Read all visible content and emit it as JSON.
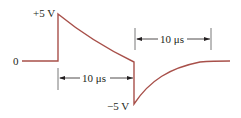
{
  "diagram": {
    "title": "",
    "labels": {
      "zero": "0",
      "plus_peak": "+5 V",
      "minus_peak": "−5 V",
      "interval_pulse": "10 μs",
      "interval_decay": "10 μs"
    },
    "colors": {
      "waveform": "#a8504a",
      "annotation": "#231f20"
    },
    "waveform": {
      "description": "Voltage waveform: 0 baseline, jumps to +5 V, decays exponentially for 10 μs, steps down to −5 V, then decays back toward 0",
      "segments": [
        {
          "type": "baseline",
          "value": "0"
        },
        {
          "type": "step-up",
          "to": "+5 V"
        },
        {
          "type": "exponential-decay",
          "duration": "10 μs"
        },
        {
          "type": "step-down",
          "to": "−5 V"
        },
        {
          "type": "exponential-recovery",
          "to": "0"
        }
      ]
    }
  }
}
